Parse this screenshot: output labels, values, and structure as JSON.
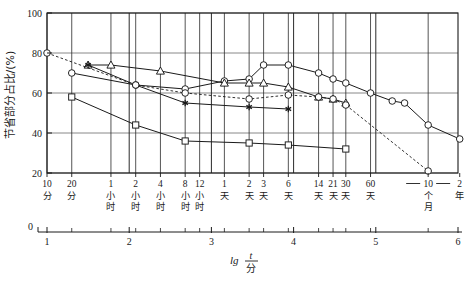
{
  "chart_data": {
    "type": "line",
    "title": "",
    "xlabel": "lg t/分",
    "ylabel": "节省部分占比/(%)",
    "xlim": [
      1,
      6
    ],
    "ylim": [
      20,
      100
    ],
    "grid": true,
    "legend_position": "none",
    "y_ticks": [
      "20",
      "40",
      "60",
      "80",
      "100"
    ],
    "y_tick_values": [
      20,
      40,
      60,
      80,
      100
    ],
    "x_axis_scale_ticks": [
      "1",
      "2",
      "3",
      "4",
      "5",
      "6"
    ],
    "x_axis_scale_values": [
      1,
      2,
      3,
      4,
      5,
      6
    ],
    "x_axis_origin_label": "0",
    "time_tick_labels": [
      {
        "text": "10分",
        "lines": [
          "10",
          "分"
        ],
        "lg": 1.0
      },
      {
        "text": "20分",
        "lines": [
          "20",
          "分"
        ],
        "lg": 1.301
      },
      {
        "text": "1小时",
        "lines": [
          "1",
          "小",
          "时"
        ],
        "lg": 1.778
      },
      {
        "text": "2小时",
        "lines": [
          "2",
          "小",
          "时"
        ],
        "lg": 2.079
      },
      {
        "text": "4小时",
        "lines": [
          "4",
          "小",
          "时"
        ],
        "lg": 2.38
      },
      {
        "text": "8小时",
        "lines": [
          "8",
          "小",
          "时"
        ],
        "lg": 2.681
      },
      {
        "text": "12小时",
        "lines": [
          "12",
          "小",
          "时"
        ],
        "lg": 2.857
      },
      {
        "text": "1天",
        "lines": [
          "1",
          "天"
        ],
        "lg": 3.158
      },
      {
        "text": "2天",
        "lines": [
          "2",
          "天"
        ],
        "lg": 3.459
      },
      {
        "text": "3天",
        "lines": [
          "3",
          "天"
        ],
        "lg": 3.635
      },
      {
        "text": "6天",
        "lines": [
          "6",
          "天"
        ],
        "lg": 3.936
      },
      {
        "text": "14天",
        "lines": [
          "14",
          "天"
        ],
        "lg": 4.304
      },
      {
        "text": "21天",
        "lines": [
          "21",
          "天"
        ],
        "lg": 4.48
      },
      {
        "text": "30天",
        "lines": [
          "30",
          "天"
        ],
        "lg": 4.635
      },
      {
        "text": "60天",
        "lines": [
          "60",
          "天"
        ],
        "lg": 4.936
      },
      {
        "text": "10个月",
        "lines": [
          "10",
          "个",
          "月"
        ],
        "lg": 5.637
      },
      {
        "text": "2年",
        "lines": [
          "2",
          "年"
        ],
        "lg": 6.021
      }
    ],
    "series": [
      {
        "name": "series-circle-solid",
        "marker": "circle",
        "line": "solid",
        "color": "#1a1a1a",
        "points": [
          {
            "x": 1.301,
            "y": 70
          },
          {
            "x": 2.079,
            "y": 64
          },
          {
            "x": 2.681,
            "y": 62
          },
          {
            "x": 3.158,
            "y": 66
          },
          {
            "x": 3.459,
            "y": 67
          },
          {
            "x": 3.635,
            "y": 74
          },
          {
            "x": 3.936,
            "y": 74
          },
          {
            "x": 4.304,
            "y": 70
          },
          {
            "x": 4.48,
            "y": 67
          },
          {
            "x": 4.635,
            "y": 65
          },
          {
            "x": 4.936,
            "y": 60
          },
          {
            "x": 5.2,
            "y": 56
          },
          {
            "x": 5.35,
            "y": 55
          },
          {
            "x": 5.637,
            "y": 44
          },
          {
            "x": 6.021,
            "y": 37
          }
        ]
      },
      {
        "name": "series-triangle-solid",
        "marker": "triangle",
        "line": "solid",
        "color": "#1a1a1a",
        "points": [
          {
            "x": 1.5,
            "y": 74
          },
          {
            "x": 1.778,
            "y": 74
          },
          {
            "x": 2.38,
            "y": 71
          },
          {
            "x": 3.158,
            "y": 65
          },
          {
            "x": 3.459,
            "y": 65
          },
          {
            "x": 3.635,
            "y": 65
          },
          {
            "x": 3.936,
            "y": 63
          },
          {
            "x": 4.304,
            "y": 58
          },
          {
            "x": 4.48,
            "y": 57
          },
          {
            "x": 4.635,
            "y": 55
          }
        ]
      },
      {
        "name": "series-square-solid",
        "marker": "square",
        "line": "solid",
        "color": "#1a1a1a",
        "points": [
          {
            "x": 1.301,
            "y": 58
          },
          {
            "x": 2.079,
            "y": 44
          },
          {
            "x": 2.681,
            "y": 36
          },
          {
            "x": 3.459,
            "y": 35
          },
          {
            "x": 3.936,
            "y": 34
          },
          {
            "x": 4.635,
            "y": 32
          }
        ]
      },
      {
        "name": "series-star-solid",
        "marker": "star",
        "line": "solid",
        "color": "#1a1a1a",
        "points": [
          {
            "x": 1.5,
            "y": 74
          },
          {
            "x": 2.079,
            "y": 64
          },
          {
            "x": 2.681,
            "y": 55
          },
          {
            "x": 3.459,
            "y": 53
          },
          {
            "x": 3.936,
            "y": 52
          }
        ]
      },
      {
        "name": "series-circle-dashed",
        "marker": "circle",
        "line": "dashed",
        "color": "#1a1a1a",
        "points": [
          {
            "x": 1.0,
            "y": 80
          },
          {
            "x": 2.079,
            "y": 64
          },
          {
            "x": 2.681,
            "y": 60
          },
          {
            "x": 3.459,
            "y": 57
          },
          {
            "x": 3.936,
            "y": 59
          },
          {
            "x": 4.304,
            "y": 58
          },
          {
            "x": 4.48,
            "y": 57
          },
          {
            "x": 4.635,
            "y": 54
          },
          {
            "x": 5.637,
            "y": 21
          }
        ]
      }
    ]
  }
}
